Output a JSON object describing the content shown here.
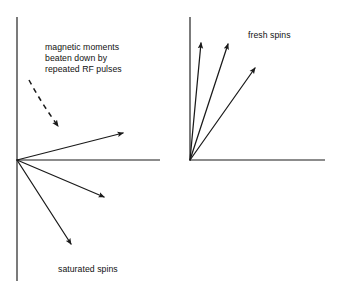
{
  "figure": {
    "background_color": "#ffffff",
    "ink_color": "#1a1a1a",
    "width": 339,
    "height": 296,
    "panels": [
      {
        "id": "left-panel",
        "name": "saturated-spins-panel",
        "origin": {
          "x": 17,
          "y": 160
        },
        "axes": {
          "vertical": {
            "x": 17,
            "y_top": 17,
            "y_bottom": 281
          },
          "horizontal": {
            "y": 160,
            "x_start": 17,
            "x_end": 160
          }
        },
        "annotation": {
          "label_lines": [
            "magnetic moments",
            "beaten down by",
            "repeated RF pulses"
          ],
          "label_x": 45,
          "label_first_baseline_y": 50,
          "label_line_height": 11,
          "curve_arrow": {
            "name": "dashed-curved-arrow",
            "path_start": {
              "x": 29,
              "y": 80
            },
            "path_end": {
              "x": 63,
              "y": 131
            },
            "style": "dashed",
            "arrowhead": "down"
          }
        },
        "caption": {
          "text": "saturated spins",
          "x": 58,
          "baseline_y": 272
        },
        "vectors": [
          {
            "name": "spin-vector-1",
            "tip": {
              "x": 123,
              "y": 133
            },
            "angle_deg": 10.7,
            "length": 108
          },
          {
            "name": "spin-vector-2",
            "tip": {
              "x": 104,
              "y": 197
            },
            "angle_deg": -23.0,
            "length": 95
          },
          {
            "name": "spin-vector-3",
            "tip": {
              "x": 71,
              "y": 244
            },
            "angle_deg": -57.2,
            "length": 99
          }
        ]
      },
      {
        "id": "right-panel",
        "name": "fresh-spins-panel",
        "origin": {
          "x": 190,
          "y": 160
        },
        "axes": {
          "vertical": {
            "x": 190,
            "y_top": 17,
            "y_bottom": 160
          },
          "horizontal": {
            "y": 160,
            "x_start": 190,
            "x_end": 325
          }
        },
        "caption": {
          "text": "fresh spins",
          "x": 248,
          "baseline_y": 38
        },
        "vectors": [
          {
            "name": "spin-vector-1",
            "tip": {
              "x": 201,
              "y": 43
            },
            "angle_deg": 84.6,
            "length": 117
          },
          {
            "name": "spin-vector-2",
            "tip": {
              "x": 228,
              "y": 44
            },
            "angle_deg": 74.5,
            "length": 120
          },
          {
            "name": "spin-vector-3",
            "tip": {
              "x": 255,
              "y": 68
            },
            "angle_deg": 58.3,
            "length": 110
          }
        ]
      }
    ]
  }
}
